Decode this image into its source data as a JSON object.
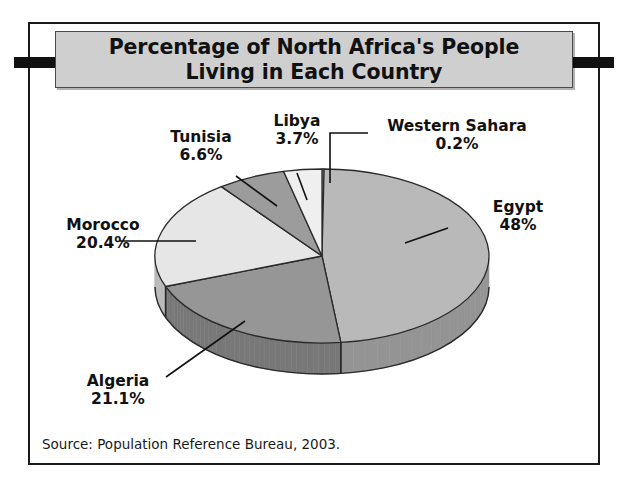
{
  "figure": {
    "title": "Percentage of North Africa's People\nLiving in Each Country",
    "source": "Source: Population Reference Bureau, 2003."
  },
  "labels": {
    "tunisia": "Tunisia\n6.6%",
    "libya": "Libya\n3.7%",
    "western_sahara": "Western Sahara\n0.2%",
    "egypt": "Egypt\n48%",
    "morocco": "Morocco\n20.4%",
    "algeria": "Algeria\n21.1%"
  },
  "chart_data": {
    "type": "pie",
    "title": "Percentage of North Africa's People Living in Each Country",
    "subtitle": "",
    "xlabel": "",
    "ylabel": "",
    "grid": false,
    "legend_position": "none",
    "annotation": "Source: Population Reference Bureau, 2003.",
    "units": "percent",
    "three_d": true,
    "start_angle_deg": 0,
    "direction": "clockwise",
    "categories": [
      "Western Sahara",
      "Egypt",
      "Algeria",
      "Morocco",
      "Tunisia",
      "Libya"
    ],
    "values": [
      0.2,
      48,
      21.1,
      20.4,
      6.6,
      3.7
    ],
    "value_labels": [
      "0.2%",
      "48%",
      "21.1%",
      "20.4%",
      "6.6%",
      "3.7%"
    ],
    "slice_colors": [
      "#f2f2f2",
      "#b9b9b9",
      "#969696",
      "#e6e6e6",
      "#9c9c9c",
      "#efefef"
    ],
    "slices": [
      {
        "name": "Western Sahara",
        "value": 0.2,
        "label": "Western Sahara\n0.2%",
        "color": "#f2f2f2"
      },
      {
        "name": "Egypt",
        "value": 48,
        "label": "Egypt\n48%",
        "color": "#b9b9b9"
      },
      {
        "name": "Algeria",
        "value": 21.1,
        "label": "Algeria\n21.1%",
        "color": "#969696"
      },
      {
        "name": "Morocco",
        "value": 20.4,
        "label": "Morocco\n20.4%",
        "color": "#e6e6e6"
      },
      {
        "name": "Tunisia",
        "value": 6.6,
        "label": "Tunisia\n6.6%",
        "color": "#9c9c9c"
      },
      {
        "name": "Libya",
        "value": 3.7,
        "label": "Libya\n3.7%",
        "color": "#efefef"
      }
    ],
    "total": 100.0
  },
  "colors": {
    "frame_border": "#1a1a1a",
    "title_plate_bg": "#cfcfcf",
    "tab": "#111111",
    "page_bg": "#ffffff",
    "text": "#111111"
  }
}
